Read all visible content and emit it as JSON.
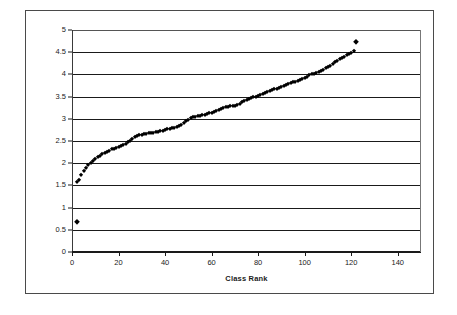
{
  "chart_data": {
    "type": "scatter",
    "title": "",
    "xlabel": "Class Rank",
    "ylabel": "",
    "xlim": [
      0,
      150
    ],
    "ylim": [
      0,
      5
    ],
    "grid": true,
    "legend": null,
    "x_ticks": [
      "0",
      "20",
      "40",
      "60",
      "80",
      "100",
      "120",
      "140"
    ],
    "x_tick_values": [
      0,
      20,
      40,
      60,
      80,
      100,
      120,
      140
    ],
    "y_ticks": [
      "0",
      "0.5",
      "1",
      "1.5",
      "2",
      "2.5",
      "3",
      "3.5",
      "4",
      "4.5",
      "5"
    ],
    "y_tick_values": [
      0,
      0.5,
      1,
      1.5,
      2,
      2.5,
      3,
      3.5,
      4,
      4.5,
      5
    ],
    "marker": "diamond",
    "marker_color": "#000000",
    "series": [
      {
        "name": "GPA by Class Rank",
        "x": [
          2,
          2,
          3,
          4,
          5,
          6,
          7,
          8,
          9,
          10,
          11,
          12,
          13,
          14,
          15,
          16,
          17,
          18,
          19,
          20,
          21,
          22,
          23,
          24,
          25,
          26,
          27,
          28,
          29,
          30,
          31,
          32,
          33,
          34,
          35,
          36,
          37,
          38,
          39,
          40,
          41,
          42,
          43,
          44,
          45,
          46,
          47,
          48,
          49,
          50,
          51,
          52,
          53,
          54,
          55,
          56,
          57,
          58,
          59,
          60,
          61,
          62,
          63,
          64,
          65,
          66,
          67,
          68,
          69,
          70,
          71,
          72,
          73,
          74,
          75,
          76,
          77,
          78,
          79,
          80,
          81,
          82,
          83,
          84,
          85,
          86,
          87,
          88,
          89,
          90,
          91,
          92,
          93,
          94,
          95,
          96,
          97,
          98,
          99,
          100,
          101,
          102,
          103,
          104,
          105,
          106,
          107,
          108,
          109,
          110,
          111,
          112,
          113,
          114,
          115,
          116,
          117,
          118,
          119,
          120,
          121,
          122
        ],
        "y": [
          0.67,
          1.58,
          1.63,
          1.74,
          1.83,
          1.9,
          1.96,
          2.01,
          2.06,
          2.1,
          2.14,
          2.17,
          2.2,
          2.23,
          2.26,
          2.28,
          2.31,
          2.33,
          2.35,
          2.37,
          2.39,
          2.41,
          2.44,
          2.47,
          2.5,
          2.54,
          2.58,
          2.61,
          2.63,
          2.64,
          2.65,
          2.66,
          2.67,
          2.68,
          2.69,
          2.7,
          2.71,
          2.72,
          2.73,
          2.74,
          2.76,
          2.78,
          2.79,
          2.8,
          2.81,
          2.83,
          2.86,
          2.9,
          2.94,
          2.98,
          3.01,
          3.03,
          3.05,
          3.06,
          3.07,
          3.08,
          3.09,
          3.1,
          3.12,
          3.14,
          3.16,
          3.18,
          3.2,
          3.22,
          3.24,
          3.26,
          3.27,
          3.28,
          3.28,
          3.29,
          3.31,
          3.34,
          3.37,
          3.4,
          3.42,
          3.44,
          3.46,
          3.48,
          3.5,
          3.52,
          3.54,
          3.56,
          3.58,
          3.6,
          3.62,
          3.64,
          3.66,
          3.68,
          3.7,
          3.72,
          3.74,
          3.76,
          3.78,
          3.8,
          3.82,
          3.84,
          3.86,
          3.88,
          3.9,
          3.92,
          3.95,
          3.98,
          4.0,
          4.02,
          4.04,
          4.06,
          4.08,
          4.11,
          4.14,
          4.17,
          4.2,
          4.24,
          4.28,
          4.31,
          4.34,
          4.37,
          4.4,
          4.43,
          4.46,
          4.49,
          4.52,
          4.72
        ]
      }
    ],
    "annotations": [
      {
        "label": "low-outlier",
        "x": 2,
        "y": 0.67
      },
      {
        "label": "high-outlier",
        "x": 122,
        "y": 4.72
      }
    ],
    "outlier_indices": [
      0,
      121
    ]
  },
  "colors": {
    "marker": "#000000",
    "gridline": "#1a1a1a",
    "frame": "#4a4a4a",
    "background": "#ffffff",
    "text": "#1a1a1a"
  }
}
